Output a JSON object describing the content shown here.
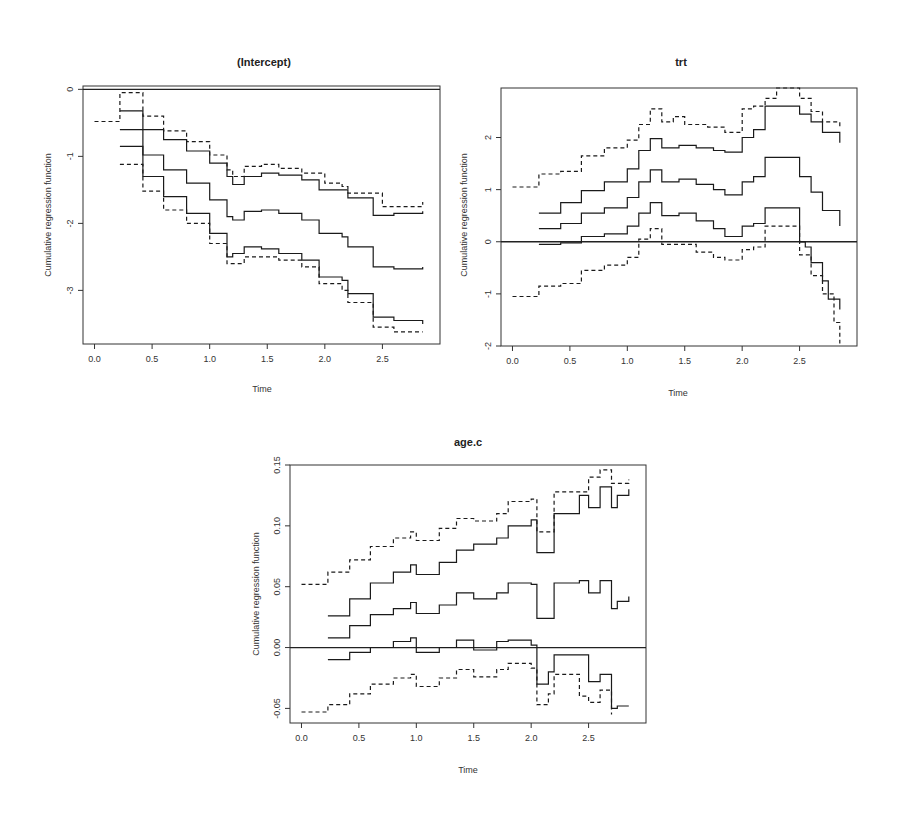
{
  "chart_data": [
    {
      "type": "line",
      "title": "(Intercept)",
      "xlabel": "Time",
      "ylabel": "Cumulative regression function",
      "xlim": [
        -0.1,
        3.0
      ],
      "ylim": [
        -3.8,
        0.05
      ],
      "xticks": [
        0.0,
        0.5,
        1.0,
        1.5,
        2.0,
        2.5
      ],
      "xtick_labels": [
        "0.0",
        "0.5",
        "1.0",
        "1.5",
        "2.0",
        "2.5"
      ],
      "yticks": [
        0,
        -1,
        -2,
        -3
      ],
      "ytick_labels": [
        "0",
        "-1",
        "-2",
        "-3"
      ],
      "hline": 0,
      "series": [
        {
          "name": "upper-band",
          "style": "dashed",
          "x": [
            0.0,
            0.22,
            0.22,
            0.42,
            0.42,
            0.6,
            0.8,
            1.0,
            1.15,
            1.2,
            1.3,
            1.45,
            1.6,
            1.8,
            2.0,
            2.15,
            2.2,
            2.42,
            2.5,
            2.85
          ],
          "y": [
            -0.48,
            -0.48,
            -0.05,
            -0.05,
            -0.4,
            -0.62,
            -0.78,
            -0.98,
            -1.2,
            -1.3,
            -1.15,
            -1.12,
            -1.18,
            -1.25,
            -1.4,
            -1.45,
            -1.55,
            -1.55,
            -1.75,
            -1.68
          ]
        },
        {
          "name": "upper-ci",
          "style": "solid",
          "x": [
            0.22,
            0.42,
            0.42,
            0.6,
            0.8,
            1.0,
            1.15,
            1.2,
            1.3,
            1.45,
            1.6,
            1.8,
            1.95,
            2.15,
            2.2,
            2.42,
            2.42,
            2.6,
            2.85
          ],
          "y": [
            -0.32,
            -0.32,
            -0.6,
            -0.75,
            -0.92,
            -1.1,
            -1.3,
            -1.42,
            -1.3,
            -1.25,
            -1.28,
            -1.35,
            -1.5,
            -1.5,
            -1.62,
            -1.62,
            -1.88,
            -1.85,
            -1.82
          ]
        },
        {
          "name": "estimate",
          "style": "solid",
          "x": [
            0.22,
            0.42,
            0.42,
            0.6,
            0.8,
            1.0,
            1.15,
            1.2,
            1.3,
            1.45,
            1.6,
            1.8,
            1.95,
            2.15,
            2.2,
            2.42,
            2.42,
            2.6,
            2.85
          ],
          "y": [
            -0.6,
            -0.6,
            -0.98,
            -1.2,
            -1.4,
            -1.65,
            -1.9,
            -1.95,
            -1.82,
            -1.8,
            -1.85,
            -1.95,
            -2.15,
            -2.2,
            -2.35,
            -2.35,
            -2.65,
            -2.68,
            -2.65
          ]
        },
        {
          "name": "lower-ci",
          "style": "solid",
          "x": [
            0.22,
            0.42,
            0.42,
            0.6,
            0.8,
            1.0,
            1.15,
            1.2,
            1.3,
            1.45,
            1.6,
            1.8,
            1.95,
            2.15,
            2.2,
            2.42,
            2.42,
            2.6,
            2.85
          ],
          "y": [
            -0.85,
            -0.85,
            -1.3,
            -1.6,
            -1.85,
            -2.15,
            -2.5,
            -2.45,
            -2.35,
            -2.38,
            -2.45,
            -2.55,
            -2.8,
            -2.85,
            -3.05,
            -3.05,
            -3.4,
            -3.45,
            -3.5
          ]
        },
        {
          "name": "lower-band",
          "style": "dashed",
          "x": [
            0.22,
            0.42,
            0.42,
            0.6,
            0.8,
            1.0,
            1.15,
            1.2,
            1.3,
            1.45,
            1.6,
            1.8,
            1.95,
            2.15,
            2.2,
            2.42,
            2.42,
            2.6,
            2.85
          ],
          "y": [
            -1.12,
            -1.12,
            -1.52,
            -1.8,
            -2.0,
            -2.3,
            -2.6,
            -2.6,
            -2.5,
            -2.5,
            -2.55,
            -2.65,
            -2.9,
            -3.0,
            -3.18,
            -3.18,
            -3.55,
            -3.62,
            -3.62
          ]
        }
      ]
    },
    {
      "type": "line",
      "title": "trt",
      "xlabel": "Time",
      "ylabel": "Cumulative regression function",
      "xlim": [
        -0.1,
        3.0
      ],
      "ylim": [
        -2.0,
        2.95
      ],
      "xticks": [
        0.0,
        0.5,
        1.0,
        1.5,
        2.0,
        2.5
      ],
      "xtick_labels": [
        "0.0",
        "0.5",
        "1.0",
        "1.5",
        "2.0",
        "2.5"
      ],
      "yticks": [
        2,
        1,
        0,
        -1,
        -2
      ],
      "ytick_labels": [
        "2",
        "1",
        "0",
        "-1",
        "-2"
      ],
      "hline": 0,
      "series": [
        {
          "name": "upper-band",
          "style": "dashed",
          "x": [
            0.0,
            0.23,
            0.23,
            0.42,
            0.6,
            0.8,
            1.0,
            1.1,
            1.2,
            1.3,
            1.4,
            1.5,
            1.7,
            1.85,
            2.0,
            2.1,
            2.2,
            2.3,
            2.4,
            2.5,
            2.6,
            2.7,
            2.85
          ],
          "y": [
            1.05,
            1.05,
            1.3,
            1.35,
            1.65,
            1.8,
            1.95,
            2.25,
            2.55,
            2.3,
            2.4,
            2.25,
            2.2,
            2.1,
            2.55,
            2.6,
            2.75,
            2.95,
            2.95,
            2.75,
            2.5,
            2.3,
            2.2
          ]
        },
        {
          "name": "upper-ci",
          "style": "solid",
          "x": [
            0.23,
            0.42,
            0.42,
            0.6,
            0.8,
            1.0,
            1.1,
            1.2,
            1.3,
            1.45,
            1.6,
            1.75,
            1.85,
            2.0,
            2.1,
            2.2,
            2.2,
            2.42,
            2.5,
            2.6,
            2.7,
            2.85
          ],
          "y": [
            0.55,
            0.55,
            0.75,
            0.98,
            1.15,
            1.4,
            1.75,
            1.98,
            1.8,
            1.85,
            1.8,
            1.75,
            1.72,
            2.0,
            2.15,
            2.15,
            2.6,
            2.6,
            2.45,
            2.3,
            2.1,
            1.9
          ]
        },
        {
          "name": "estimate",
          "style": "solid",
          "x": [
            0.23,
            0.42,
            0.42,
            0.6,
            0.8,
            1.0,
            1.1,
            1.2,
            1.3,
            1.45,
            1.6,
            1.75,
            1.85,
            2.0,
            2.1,
            2.2,
            2.2,
            2.42,
            2.5,
            2.6,
            2.7,
            2.85
          ],
          "y": [
            0.25,
            0.25,
            0.35,
            0.55,
            0.65,
            0.85,
            1.15,
            1.38,
            1.15,
            1.2,
            1.1,
            1.0,
            0.9,
            1.15,
            1.25,
            1.3,
            1.62,
            1.62,
            1.25,
            0.95,
            0.6,
            0.3
          ]
        },
        {
          "name": "lower-ci",
          "style": "solid",
          "x": [
            0.23,
            0.42,
            0.42,
            0.6,
            0.8,
            1.0,
            1.1,
            1.2,
            1.3,
            1.45,
            1.6,
            1.75,
            1.85,
            2.0,
            2.1,
            2.2,
            2.2,
            2.42,
            2.5,
            2.55,
            2.6,
            2.7,
            2.75,
            2.85
          ],
          "y": [
            -0.05,
            -0.05,
            -0.02,
            0.1,
            0.15,
            0.3,
            0.55,
            0.75,
            0.5,
            0.55,
            0.4,
            0.25,
            0.1,
            0.3,
            0.35,
            0.35,
            0.65,
            0.65,
            0.0,
            -0.1,
            -0.4,
            -0.75,
            -1.1,
            -1.3
          ]
        },
        {
          "name": "lower-band",
          "style": "dashed",
          "x": [
            0.0,
            0.23,
            0.23,
            0.42,
            0.6,
            0.8,
            1.0,
            1.1,
            1.2,
            1.3,
            1.45,
            1.6,
            1.75,
            1.85,
            2.0,
            2.1,
            2.2,
            2.42,
            2.5,
            2.6,
            2.7,
            2.8,
            2.85
          ],
          "y": [
            -1.05,
            -1.05,
            -0.85,
            -0.8,
            -0.55,
            -0.45,
            -0.3,
            0.05,
            0.25,
            -0.05,
            -0.05,
            -0.2,
            -0.3,
            -0.35,
            -0.15,
            -0.1,
            0.3,
            0.3,
            -0.25,
            -0.65,
            -1.0,
            -1.55,
            -1.95
          ]
        }
      ]
    },
    {
      "type": "line",
      "title": "age.c",
      "xlabel": "Time",
      "ylabel": "Cumulative regression function",
      "xlim": [
        -0.1,
        3.0
      ],
      "ylim": [
        -0.062,
        0.15
      ],
      "xticks": [
        0.0,
        0.5,
        1.0,
        1.5,
        2.0,
        2.5
      ],
      "xtick_labels": [
        "0.0",
        "0.5",
        "1.0",
        "1.5",
        "2.0",
        "2.5"
      ],
      "yticks": [
        0.15,
        0.1,
        0.05,
        0.0,
        -0.05
      ],
      "ytick_labels": [
        "0.15",
        "0.10",
        "0.05",
        "0.00",
        "-0.05"
      ],
      "hline": 0,
      "series": [
        {
          "name": "upper-band",
          "style": "dashed",
          "x": [
            0.0,
            0.23,
            0.23,
            0.42,
            0.42,
            0.6,
            0.8,
            0.95,
            1.0,
            1.2,
            1.35,
            1.5,
            1.7,
            1.8,
            2.0,
            2.05,
            2.15,
            2.2,
            2.42,
            2.5,
            2.6,
            2.7,
            2.85
          ],
          "y": [
            0.052,
            0.052,
            0.062,
            0.062,
            0.072,
            0.083,
            0.09,
            0.095,
            0.088,
            0.098,
            0.106,
            0.104,
            0.11,
            0.12,
            0.122,
            0.095,
            0.095,
            0.128,
            0.128,
            0.14,
            0.146,
            0.135,
            0.138
          ]
        },
        {
          "name": "upper-ci",
          "style": "solid",
          "x": [
            0.23,
            0.42,
            0.42,
            0.6,
            0.8,
            0.95,
            1.0,
            1.2,
            1.35,
            1.5,
            1.7,
            1.8,
            2.0,
            2.05,
            2.15,
            2.2,
            2.42,
            2.5,
            2.6,
            2.7,
            2.75,
            2.85
          ],
          "y": [
            0.026,
            0.026,
            0.04,
            0.053,
            0.062,
            0.068,
            0.06,
            0.07,
            0.08,
            0.085,
            0.09,
            0.1,
            0.105,
            0.078,
            0.078,
            0.11,
            0.125,
            0.115,
            0.132,
            0.115,
            0.125,
            0.13
          ]
        },
        {
          "name": "estimate",
          "style": "solid",
          "x": [
            0.23,
            0.42,
            0.42,
            0.6,
            0.8,
            0.95,
            1.0,
            1.2,
            1.35,
            1.5,
            1.7,
            1.8,
            2.0,
            2.05,
            2.15,
            2.2,
            2.42,
            2.5,
            2.6,
            2.7,
            2.75,
            2.85
          ],
          "y": [
            0.008,
            0.008,
            0.018,
            0.027,
            0.032,
            0.037,
            0.028,
            0.035,
            0.045,
            0.04,
            0.045,
            0.053,
            0.052,
            0.024,
            0.024,
            0.053,
            0.055,
            0.045,
            0.055,
            0.032,
            0.038,
            0.042
          ]
        },
        {
          "name": "lower-ci",
          "style": "solid",
          "x": [
            0.23,
            0.42,
            0.42,
            0.6,
            0.8,
            0.95,
            1.0,
            1.2,
            1.35,
            1.5,
            1.7,
            1.8,
            2.0,
            2.05,
            2.15,
            2.2,
            2.42,
            2.5,
            2.6,
            2.7,
            2.75,
            2.85
          ],
          "y": [
            -0.01,
            -0.01,
            -0.004,
            0.0,
            0.005,
            0.008,
            -0.004,
            0.0,
            0.006,
            -0.002,
            0.005,
            0.006,
            0.002,
            -0.03,
            -0.02,
            -0.006,
            -0.006,
            -0.028,
            -0.022,
            -0.05,
            -0.048,
            -0.048
          ]
        },
        {
          "name": "lower-band",
          "style": "dashed",
          "x": [
            0.0,
            0.23,
            0.23,
            0.42,
            0.42,
            0.6,
            0.8,
            0.95,
            1.0,
            1.2,
            1.35,
            1.5,
            1.7,
            1.8,
            2.0,
            2.05,
            2.15,
            2.2,
            2.42,
            2.5,
            2.6,
            2.7
          ],
          "y": [
            -0.053,
            -0.053,
            -0.047,
            -0.047,
            -0.038,
            -0.03,
            -0.025,
            -0.022,
            -0.032,
            -0.025,
            -0.018,
            -0.024,
            -0.018,
            -0.013,
            -0.017,
            -0.047,
            -0.038,
            -0.022,
            -0.04,
            -0.045,
            -0.035,
            -0.055
          ]
        }
      ]
    }
  ]
}
